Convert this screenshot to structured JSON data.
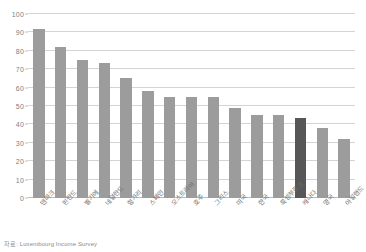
{
  "source_note": "자료: Luxembourg Income Survey",
  "colors": {
    "bar": "#9c9c9c",
    "bar_highlight": "#575757",
    "gridline": "#d4d4d4",
    "axis_text": "#808080",
    "label_text": "#6e6e6e",
    "background": "#ffffff"
  },
  "chart_data": {
    "type": "bar",
    "title": "",
    "subtitle": "",
    "xlabel": "",
    "ylabel": "",
    "ylim": [
      0,
      100
    ],
    "yticks": [
      0,
      10,
      20,
      30,
      40,
      50,
      60,
      70,
      80,
      90,
      100
    ],
    "ytick_labels": [
      "0",
      "10",
      "20",
      "30",
      "40",
      "50",
      "60",
      "70",
      "80",
      "90",
      "100"
    ],
    "grid": true,
    "legend": false,
    "highlight_category": "한국",
    "highlight_index": 12,
    "categories": [
      "덴마크",
      "핀란드",
      "벨기에",
      "네덜란드",
      "헝가리",
      "스페인",
      "오스트리아",
      "호주",
      "그리스",
      "미국",
      "한국",
      "룩셈부르크",
      "캐나다",
      "영국",
      "아일랜드"
    ],
    "values": [
      92,
      82,
      75,
      73.5,
      65,
      58,
      55,
      55,
      55,
      49,
      45,
      45,
      43.5,
      38,
      32
    ],
    "series": [
      {
        "name": "값",
        "values": [
          92,
          82,
          75,
          73.5,
          65,
          58,
          55,
          55,
          55,
          49,
          45,
          45,
          43.5,
          38,
          32
        ]
      }
    ]
  }
}
